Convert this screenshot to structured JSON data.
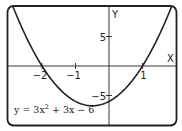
{
  "chart_data": {
    "type": "line",
    "title": "",
    "equation": "y = 3x^2 + 3x - 6",
    "equation_parts": {
      "lhs": "y = 3x",
      "exp": "2",
      "rhs": " + 3x − 6"
    },
    "xlabel": "X",
    "ylabel": "Y",
    "xlim": [
      -3.0,
      2.0
    ],
    "ylim": [
      -10,
      10
    ],
    "x_ticks": [
      {
        "value": -2,
        "label": "−2"
      },
      {
        "value": -1,
        "label": "−1"
      },
      {
        "value": 1,
        "label": "1"
      }
    ],
    "y_ticks": [
      {
        "value": 5,
        "label": "5"
      },
      {
        "value": -5,
        "label": "−5"
      }
    ],
    "roots": [
      -2,
      1
    ],
    "vertex": {
      "x": -0.5,
      "y": -6.75
    },
    "grid": false,
    "colors": {
      "curve": "#222222",
      "axes": "#222222",
      "frame": "#222222"
    }
  }
}
